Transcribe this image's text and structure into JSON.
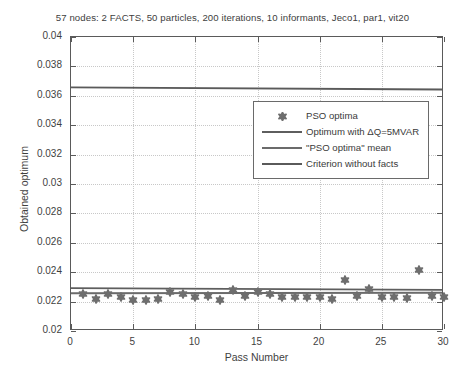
{
  "chart_data": {
    "type": "scatter",
    "title": "57 nodes: 2 FACTS, 50 particles, 200 iterations, 10 informants, Jeco1, par1, vit20",
    "xlabel": "Pass Number",
    "ylabel": "Obtained optimum",
    "xlim": [
      0,
      30
    ],
    "ylim": [
      0.02,
      0.04
    ],
    "xticks": [
      0,
      5,
      10,
      15,
      20,
      25,
      30
    ],
    "xtick_labels": [
      "0",
      "5",
      "10",
      "15",
      "20",
      "25",
      "30"
    ],
    "yticks": [
      0.02,
      0.022,
      0.024,
      0.026,
      0.028,
      0.03,
      0.032,
      0.034,
      0.036,
      0.038,
      0.04
    ],
    "ytick_labels": [
      "0.02",
      "0.022",
      "0.024",
      "0.026",
      "0.028",
      "0.03",
      "0.032",
      "0.034",
      "0.036",
      "0.038",
      "0.04"
    ],
    "grid": true,
    "legend_position": "upper right",
    "series": [
      {
        "name": "PSO optima",
        "type": "scatter",
        "marker": "hexagram",
        "color": "#6e6e6e",
        "x": [
          1,
          2,
          3,
          4,
          5,
          6,
          7,
          8,
          9,
          10,
          11,
          12,
          13,
          14,
          15,
          16,
          17,
          18,
          19,
          20,
          21,
          22,
          23,
          24,
          25,
          26,
          27,
          28,
          29,
          30
        ],
        "y": [
          0.02255,
          0.02215,
          0.0225,
          0.0223,
          0.02212,
          0.02212,
          0.02215,
          0.02262,
          0.0225,
          0.02232,
          0.0224,
          0.02208,
          0.02282,
          0.02235,
          0.02265,
          0.0225,
          0.0223,
          0.0223,
          0.02232,
          0.02232,
          0.02218,
          0.02348,
          0.0224,
          0.02288,
          0.02228,
          0.02228,
          0.02225,
          0.02412,
          0.02235,
          0.0223
        ]
      },
      {
        "name": "Optimum with ΔQ=5MVAR",
        "type": "hline",
        "color": "#5e5e5e",
        "y_start": 0.0228,
        "y_end": 0.02268
      },
      {
        "name": "\"PSO optima\" mean",
        "type": "hline",
        "color": "#6b6b6b",
        "y_start": 0.02245,
        "y_end": 0.02248
      },
      {
        "name": "Criterion without facts",
        "type": "hline",
        "color": "#5a5a5a",
        "y_start": 0.03655,
        "y_end": 0.0364
      }
    ]
  },
  "legend": {
    "items": [
      {
        "label": "PSO optima",
        "key": "marker",
        "color": "#6e6e6e"
      },
      {
        "label": "Optimum with ΔQ=5MVAR",
        "key": "line",
        "color": "#5e5e5e"
      },
      {
        "label": "\"PSO optima\" mean",
        "key": "line",
        "color": "#6b6b6b"
      },
      {
        "label": "Criterion without facts",
        "key": "line",
        "color": "#5a5a5a"
      }
    ]
  },
  "colors": {
    "axis": "#5a5a5a",
    "grid": "#c8c8c8",
    "text": "#3f3f3f",
    "background": "#ffffff"
  }
}
